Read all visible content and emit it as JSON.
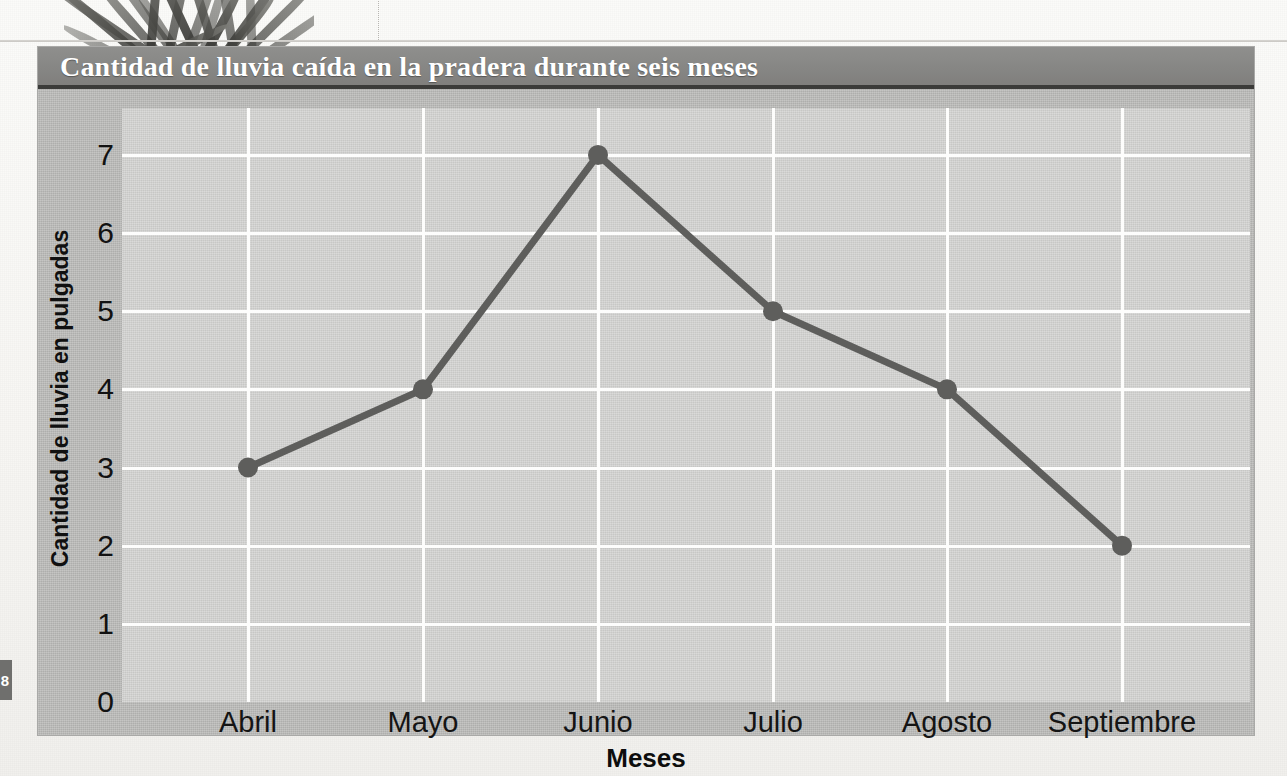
{
  "page": {
    "page_number": "8",
    "photo_alt": "grass-photo"
  },
  "figure": {
    "banner_title": "Cantidad de lluvia caída en la pradera durante seis meses",
    "banner_color": "#878785",
    "banner_rule_color": "#3b3b39",
    "frame_color": "#b9b9b7",
    "plot_bg_color": "#d0d0ce",
    "gridline_color": "#fdfdfc",
    "line_color": "#5e5e5c"
  },
  "chart_data": {
    "type": "line",
    "title": "Cantidad de lluvia caída en la pradera durante seis meses",
    "xlabel": "Meses",
    "ylabel": "Cantidad de lluvia en pulgadas",
    "categories": [
      "Abril",
      "Mayo",
      "Junio",
      "Julio",
      "Agosto",
      "Septiembre"
    ],
    "values": [
      3,
      4,
      7,
      5,
      4,
      2
    ],
    "yticks": [
      "0",
      "1",
      "2",
      "3",
      "4",
      "5",
      "6",
      "7"
    ],
    "ytick_values": [
      0,
      1,
      2,
      3,
      4,
      5,
      6,
      7
    ],
    "ylim": [
      0,
      7.6
    ],
    "grid": true,
    "legend": "none",
    "marker": "circle",
    "series": [
      {
        "name": "Lluvia",
        "values": [
          3,
          4,
          7,
          5,
          4,
          2
        ]
      }
    ]
  }
}
